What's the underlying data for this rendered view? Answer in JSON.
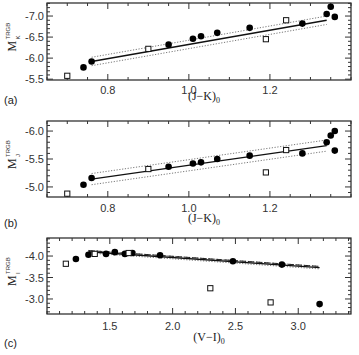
{
  "chart_data": [
    {
      "panel": "(a)",
      "type": "scatter",
      "xlabel": "(J-K)_0",
      "ylabel": "M_K^TRGB",
      "xlim": [
        0.65,
        1.4
      ],
      "ylim": [
        -5.48,
        -7.31
      ],
      "x_ticks": [
        0.8,
        1.0,
        1.2
      ],
      "y_ticks": [
        -7.0,
        -6.5,
        -6.0,
        -5.5
      ],
      "series": [
        {
          "name": "filled",
          "marker": "circle-filled",
          "points": [
            [
              0.74,
              -5.78
            ],
            [
              0.76,
              -5.92
            ],
            [
              0.95,
              -6.32
            ],
            [
              1.01,
              -6.46
            ],
            [
              1.03,
              -6.52
            ],
            [
              1.07,
              -6.6
            ],
            [
              1.15,
              -6.72
            ],
            [
              1.28,
              -6.82
            ],
            [
              1.34,
              -7.05
            ],
            [
              1.35,
              -7.22
            ],
            [
              1.36,
              -6.98
            ]
          ]
        },
        {
          "name": "open",
          "marker": "square-open",
          "points": [
            [
              0.7,
              -5.58
            ],
            [
              0.9,
              -6.22
            ],
            [
              1.19,
              -6.45
            ],
            [
              1.24,
              -6.9
            ]
          ]
        }
      ],
      "fit_line": {
        "x": [
          0.76,
          1.34
        ],
        "y": [
          -5.92,
          -6.9
        ]
      },
      "fit_band_offset": 0.1
    },
    {
      "panel": "(b)",
      "type": "scatter",
      "xlabel": "(J-K)_0",
      "ylabel": "M_J^TRGB",
      "xlim": [
        0.65,
        1.4
      ],
      "ylim": [
        -4.82,
        -6.18
      ],
      "x_ticks": [
        0.8,
        1.0,
        1.2
      ],
      "y_ticks": [
        -6.0,
        -5.5,
        -5.0
      ],
      "series": [
        {
          "name": "filled",
          "marker": "circle-filled",
          "points": [
            [
              0.74,
              -5.04
            ],
            [
              0.76,
              -5.16
            ],
            [
              0.95,
              -5.36
            ],
            [
              1.01,
              -5.42
            ],
            [
              1.03,
              -5.44
            ],
            [
              1.07,
              -5.5
            ],
            [
              1.15,
              -5.56
            ],
            [
              1.28,
              -5.6
            ],
            [
              1.34,
              -5.8
            ],
            [
              1.35,
              -5.92
            ],
            [
              1.36,
              -5.65
            ],
            [
              1.36,
              -6.0
            ]
          ]
        },
        {
          "name": "open",
          "marker": "square-open",
          "points": [
            [
              0.7,
              -4.88
            ],
            [
              0.9,
              -5.32
            ],
            [
              1.19,
              -5.26
            ],
            [
              1.24,
              -5.66
            ]
          ]
        }
      ],
      "fit_line": {
        "x": [
          0.76,
          1.34
        ],
        "y": [
          -5.14,
          -5.74
        ]
      },
      "fit_band_offset": 0.1
    },
    {
      "panel": "(c)",
      "type": "scatter",
      "xlabel": "(V-I)_0",
      "ylabel": "M_I^TRGB",
      "xlim": [
        1.0,
        3.42
      ],
      "ylim": [
        -2.65,
        -4.42
      ],
      "x_ticks": [
        1.5,
        2.0,
        2.5,
        3.0
      ],
      "y_ticks": [
        -4.0,
        -3.5,
        -3.0
      ],
      "series": [
        {
          "name": "filled",
          "marker": "circle-filled",
          "points": [
            [
              1.23,
              -3.93
            ],
            [
              1.33,
              -4.03
            ],
            [
              1.47,
              -4.05
            ],
            [
              1.54,
              -4.09
            ],
            [
              1.62,
              -4.05
            ],
            [
              1.68,
              -4.07
            ],
            [
              1.9,
              -4.02
            ],
            [
              2.48,
              -3.88
            ],
            [
              2.87,
              -3.8
            ],
            [
              3.17,
              -2.88
            ]
          ]
        },
        {
          "name": "open",
          "marker": "square-open",
          "points": [
            [
              1.15,
              -3.82
            ],
            [
              1.38,
              -4.05
            ],
            [
              1.65,
              -4.07
            ],
            [
              2.3,
              -3.25
            ],
            [
              2.78,
              -2.92
            ]
          ]
        }
      ],
      "fit_line": {
        "x": [
          1.33,
          3.17
        ],
        "y": [
          -4.1,
          -3.73
        ]
      },
      "fit_band_offset": 0.03
    }
  ],
  "labels": {
    "panel_a": "(a)",
    "panel_b": "(b)",
    "panel_c": "(c)",
    "xlabel_jk": "(J−K)",
    "xlabel_vi": "(V−I)",
    "sub0": "0",
    "ylab_main": "M",
    "ylab_sup": "TRGB",
    "ylab_k": "K",
    "ylab_j": "J",
    "ylab_i": "I"
  }
}
